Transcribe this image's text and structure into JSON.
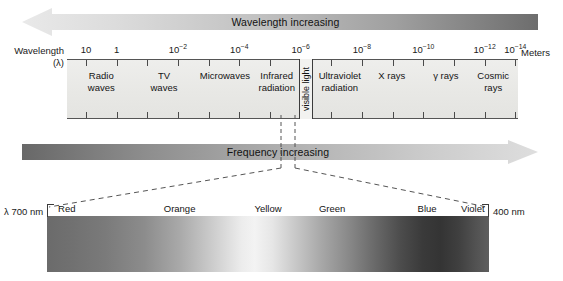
{
  "figure": {
    "background": "#ffffff"
  },
  "top_arrow": {
    "label": "Wavelength increasing",
    "direction": "left",
    "gradient_from": "#e6e6e6",
    "gradient_to": "#6e6e6e"
  },
  "bottom_arrow": {
    "label": "Frequency increasing",
    "direction": "right",
    "gradient_from": "#6a6a6a",
    "gradient_to": "#dcdcdc"
  },
  "axis": {
    "name": "Wavelength",
    "symbol": "(λ)",
    "units": "Meters",
    "ticks": [
      {
        "mantissa": "10",
        "exponent": "",
        "pos_pct": 4.2,
        "labeled": true
      },
      {
        "mantissa": "1",
        "exponent": "",
        "pos_pct": 11.0,
        "labeled": true
      },
      {
        "mantissa": "",
        "exponent": "",
        "pos_pct": 17.8,
        "labeled": false
      },
      {
        "mantissa": "10",
        "exponent": "-2",
        "pos_pct": 24.6,
        "labeled": true
      },
      {
        "mantissa": "",
        "exponent": "",
        "pos_pct": 31.4,
        "labeled": false
      },
      {
        "mantissa": "10",
        "exponent": "-4",
        "pos_pct": 38.2,
        "labeled": true
      },
      {
        "mantissa": "",
        "exponent": "",
        "pos_pct": 45.0,
        "labeled": false
      },
      {
        "mantissa": "10",
        "exponent": "-6",
        "pos_pct": 51.8,
        "labeled": true
      },
      {
        "mantissa": "",
        "exponent": "",
        "pos_pct": 58.6,
        "labeled": false
      },
      {
        "mantissa": "10",
        "exponent": "-8",
        "pos_pct": 65.4,
        "labeled": true
      },
      {
        "mantissa": "",
        "exponent": "",
        "pos_pct": 72.2,
        "labeled": false
      },
      {
        "mantissa": "10",
        "exponent": "-10",
        "pos_pct": 79.0,
        "labeled": true
      },
      {
        "mantissa": "",
        "exponent": "",
        "pos_pct": 85.8,
        "labeled": false
      },
      {
        "mantissa": "10",
        "exponent": "-12",
        "pos_pct": 92.6,
        "labeled": true
      },
      {
        "mantissa": "10",
        "exponent": "-14",
        "pos_pct": 99.4,
        "labeled": true
      }
    ]
  },
  "bands": [
    {
      "label": "Radio\nwaves",
      "center_pct": 7.6,
      "name": "radio-waves"
    },
    {
      "label": "TV\nwaves",
      "center_pct": 21.5,
      "name": "tv-waves"
    },
    {
      "label": "Microwaves",
      "center_pct": 35.0,
      "name": "microwaves"
    },
    {
      "label": "Infrared\nradiation",
      "center_pct": 46.5,
      "name": "infrared-radiation"
    },
    {
      "label": "visible light",
      "center_pct": 53.0,
      "name": "visible-light",
      "vertical": true
    },
    {
      "label": "Ultraviolet\nradiation",
      "center_pct": 60.5,
      "name": "ultraviolet-radiation"
    },
    {
      "label": "X rays",
      "center_pct": 72.0,
      "name": "x-rays"
    },
    {
      "label": "γ rays",
      "center_pct": 84.0,
      "name": "gamma-rays"
    },
    {
      "label": "Cosmic\nrays",
      "center_pct": 94.5,
      "name": "cosmic-rays"
    }
  ],
  "visible_detail": {
    "left_wavelength": "λ 700 nm",
    "right_wavelength": "400 nm",
    "colors": [
      {
        "label": "Red",
        "center_pct": 2.5,
        "anchor": "left"
      },
      {
        "label": "Orange",
        "center_pct": 30.0,
        "anchor": "center"
      },
      {
        "label": "Yellow",
        "center_pct": 50.0,
        "anchor": "center"
      },
      {
        "label": "Green",
        "center_pct": 64.5,
        "anchor": "center"
      },
      {
        "label": "Blue",
        "center_pct": 86.0,
        "anchor": "center"
      },
      {
        "label": "Violet",
        "center_pct": 99.0,
        "anchor": "right"
      }
    ]
  },
  "chart_data": {
    "type": "diagram",
    "xlabel": "Wavelength (λ) / Meters",
    "axis_ticks_meters": [
      "10",
      "1",
      "10^-2",
      "10^-4",
      "10^-6",
      "10^-8",
      "10^-10",
      "10^-12",
      "10^-14"
    ],
    "regions": [
      {
        "name": "Radio waves",
        "approx_wavelength_m": "10 to 1"
      },
      {
        "name": "TV waves",
        "approx_wavelength_m": "1 to 1e-1"
      },
      {
        "name": "Microwaves",
        "approx_wavelength_m": "1e-1 to 1e-3"
      },
      {
        "name": "Infrared radiation",
        "approx_wavelength_m": "1e-3 to 7e-7"
      },
      {
        "name": "visible light",
        "approx_wavelength_m": "7e-7 to 4e-7"
      },
      {
        "name": "Ultraviolet radiation",
        "approx_wavelength_m": "4e-7 to 1e-8"
      },
      {
        "name": "X rays",
        "approx_wavelength_m": "1e-8 to 1e-11"
      },
      {
        "name": "γ rays",
        "approx_wavelength_m": "1e-11 to 1e-13"
      },
      {
        "name": "Cosmic rays",
        "approx_wavelength_m": "below 1e-13"
      }
    ],
    "visible_spectrum_nm": {
      "red": 700,
      "violet": 400
    },
    "annotations": [
      "Wavelength increasing",
      "Frequency increasing"
    ]
  }
}
